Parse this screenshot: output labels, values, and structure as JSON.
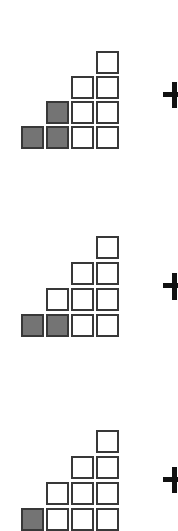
{
  "diagram": {
    "colors": {
      "filled": "#747474",
      "empty": "#ffffff",
      "border": "#383838",
      "plus": "#111111"
    },
    "columns_x": [
      21,
      46,
      71,
      96
    ],
    "groups": [
      {
        "top": 0,
        "rows_y": [
          126,
          101,
          76,
          51
        ],
        "columns": [
          {
            "height": 1,
            "filled": [
              true
            ]
          },
          {
            "height": 2,
            "filled": [
              true,
              true
            ]
          },
          {
            "height": 3,
            "filled": [
              false,
              false,
              false
            ]
          },
          {
            "height": 4,
            "filled": [
              false,
              false,
              false,
              false
            ]
          }
        ],
        "plus": {
          "h_y": 92,
          "v_top": 82,
          "v_bottom": 108
        }
      },
      {
        "top": 0,
        "rows_y": [
          314,
          288,
          262,
          236
        ],
        "columns": [
          {
            "height": 1,
            "filled": [
              true
            ]
          },
          {
            "height": 2,
            "filled": [
              true,
              false
            ]
          },
          {
            "height": 3,
            "filled": [
              false,
              false,
              false
            ]
          },
          {
            "height": 4,
            "filled": [
              false,
              false,
              false,
              false
            ]
          }
        ],
        "plus": {
          "h_y": 283,
          "v_top": 273,
          "v_bottom": 300
        }
      },
      {
        "top": 0,
        "rows_y": [
          508,
          482,
          456,
          430
        ],
        "columns": [
          {
            "height": 1,
            "filled": [
              true
            ]
          },
          {
            "height": 2,
            "filled": [
              false,
              false
            ]
          },
          {
            "height": 3,
            "filled": [
              false,
              false,
              false
            ]
          },
          {
            "height": 4,
            "filled": [
              false,
              false,
              false,
              false
            ]
          }
        ],
        "plus": {
          "h_y": 477,
          "v_top": 467,
          "v_bottom": 493
        }
      }
    ]
  }
}
